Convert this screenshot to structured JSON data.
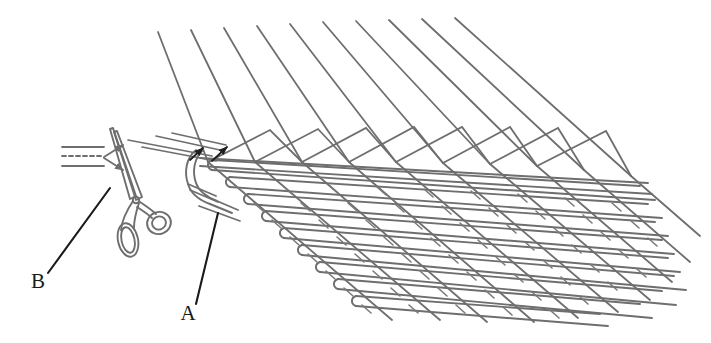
{
  "figure": {
    "type": "technical-line-drawing",
    "background_color": "#ffffff",
    "line_color": "#6e6e6e",
    "accent_color": "#1a1a1a",
    "width": 711,
    "height": 343
  },
  "labels": [
    {
      "id": "label-b",
      "text": "B",
      "x": 38,
      "y": 288,
      "refers_to": "scissors"
    },
    {
      "id": "label-a",
      "text": "A",
      "x": 188,
      "y": 320,
      "refers_to": "weft-insertion-hook"
    }
  ],
  "leaders": [
    {
      "id": "leader-b",
      "from_x": 48,
      "from_y": 273,
      "to_x": 110,
      "to_y": 188
    },
    {
      "id": "leader-a",
      "from_x": 196,
      "from_y": 304,
      "to_x": 218,
      "to_y": 213
    }
  ],
  "annotations": {
    "feed_arrows": {
      "name": "thread-feed-arrows",
      "count": 2,
      "direction": "right",
      "description": "two arrows pointing right toward the scissor blades"
    },
    "weave_arrows": {
      "name": "weave-point-arrows",
      "count": 2,
      "direction": "up-right",
      "description": "two dark arrowheads at the weaving point"
    },
    "dashed_thread": {
      "name": "dashed-thread-line",
      "style": "dashed",
      "description": "dashed centre thread between two solid feed threads"
    }
  },
  "components": [
    {
      "name": "warp-threads",
      "count": 10,
      "description": "long straight threads fanning upward from the weaving edge"
    },
    {
      "name": "weft-threads",
      "count": 9,
      "description": "horizontal threads extending to the lower right with free ends"
    },
    {
      "name": "selvedge-loops",
      "count": 9,
      "description": "U-shaped hairpin loops at the left edge of the fabric"
    },
    {
      "name": "scissors",
      "description": "open scissors with two finger loops, blades pointing up-left"
    },
    {
      "name": "weft-insertion-hook",
      "description": "curved hook guiding the weft thread at the fabric edge"
    }
  ],
  "geometry": {
    "warp": {
      "top_start_x": 158,
      "top_step_x": 33,
      "top_y": 32,
      "base_start_x": 208,
      "base_step_x": 47,
      "base_y": 162,
      "count": 10
    },
    "weft": {
      "left_x": 205,
      "left_y": 163,
      "dx_down": 18,
      "dy_down": 17,
      "right_dx": 430,
      "right_dy": 28,
      "count": 9,
      "loop_radius": 7
    }
  }
}
